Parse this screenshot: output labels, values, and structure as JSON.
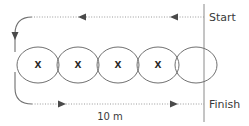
{
  "diagram": {
    "labels": {
      "start": "Start",
      "finish": "Finish",
      "distance": "10 m"
    },
    "colors": {
      "background": "#ffffff",
      "cone_stroke": "#707070",
      "path_stroke": "#6e6e6e",
      "dotted_stroke": "#9a9a9a",
      "startfinish_stroke": "#8a8a8a",
      "text": "#3a3a3a",
      "arrow_fill": "#4a4a4a"
    },
    "cones": [
      {
        "mark": "X",
        "cx": 38,
        "cy": 65,
        "rx": 21,
        "ry": 18
      },
      {
        "mark": "X",
        "cx": 78,
        "cy": 65,
        "rx": 21,
        "ry": 18
      },
      {
        "mark": "X",
        "cx": 118,
        "cy": 65,
        "rx": 21,
        "ry": 18
      },
      {
        "mark": "X",
        "cx": 158,
        "cy": 65,
        "rx": 21,
        "ry": 18
      },
      {
        "mark": "",
        "cx": 196,
        "cy": 65,
        "rx": 21,
        "ry": 18
      }
    ],
    "cone_count": 5,
    "marked_cone_count": 4,
    "start_line": {
      "x": 204,
      "y_top": 4,
      "y_bottom": 122
    },
    "top_track": {
      "direction": "right-to-left",
      "y": 17,
      "x_from": 204,
      "x_to": 30,
      "arrow_count": 2
    },
    "bottom_track": {
      "direction": "left-to-right",
      "y": 104,
      "x_from": 30,
      "x_to": 204,
      "arrow_count": 2
    }
  }
}
